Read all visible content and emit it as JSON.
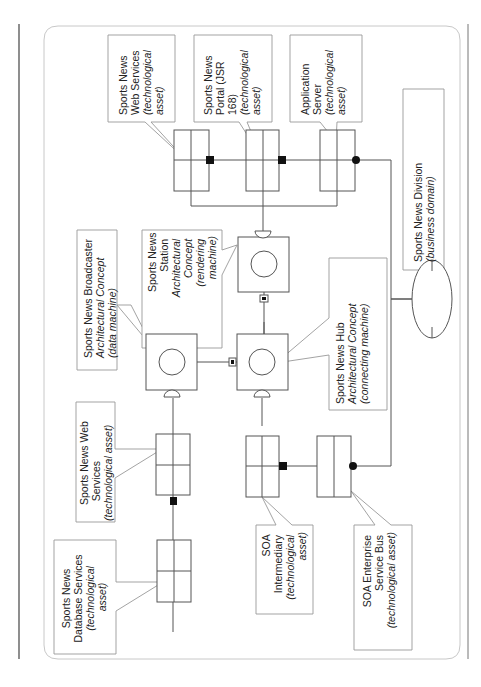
{
  "diagram": {
    "orientation": "rotated-90-clockwise",
    "colors": {
      "line": "#555555",
      "frame": "#bbbbbb",
      "callout": "#999999",
      "ink": "#111111"
    },
    "callouts": {
      "web_services_top": {
        "lines": [
          "Sports News",
          "Web Services"
        ],
        "italic": [
          "(technological",
          "asset)"
        ]
      },
      "portal": {
        "lines": [
          "Sports News",
          "Portal (JSR",
          "168)"
        ],
        "italic": [
          "(technological",
          "asset)"
        ]
      },
      "app_server": {
        "lines": [
          "Application",
          "Server"
        ],
        "italic": [
          "(technological",
          "asset)"
        ]
      },
      "division": {
        "lines": [
          "Sports News Division"
        ],
        "italic": [
          "(business domain)"
        ]
      },
      "broadcaster": {
        "lines": [
          "Sports News Broadcaster"
        ],
        "italic": [
          "Architectural Concept",
          "(data machine)"
        ]
      },
      "station": {
        "lines": [
          "Sports News",
          "Station"
        ],
        "italic": [
          "Architectural",
          "Concept",
          "(rendering",
          "machine)"
        ]
      },
      "hub": {
        "lines": [
          "Sports News Hub"
        ],
        "italic": [
          "Architectural Concept",
          "(connecting machine)"
        ]
      },
      "web_services_left": {
        "lines": [
          "Sports News Web",
          "Services"
        ],
        "italic": [
          "(technological asset)"
        ]
      },
      "database": {
        "lines": [
          "Sports News",
          "Database Services"
        ],
        "italic": [
          "(technological",
          "asset)"
        ]
      },
      "soa_intermediary": {
        "lines": [
          "SOA",
          "Intermediary"
        ],
        "italic": [
          "(technological",
          "asset)"
        ]
      },
      "soa_esb": {
        "lines": [
          "SOA Enterprise",
          "Service Bus"
        ],
        "italic": [
          "(technological asset)"
        ]
      }
    }
  }
}
